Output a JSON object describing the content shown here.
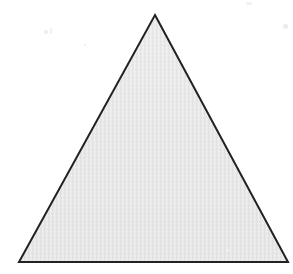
{
  "figure": {
    "canvas": {
      "width": 293,
      "height": 274,
      "background_color": "#ffffff"
    },
    "shape": {
      "name": "triangle",
      "kind": "polygon",
      "sides": 3,
      "orientation": "apex-up",
      "fill_color": "#e5e5e5",
      "stroke_color": "#222222",
      "stroke_width": 2,
      "texture": "halftone-noise",
      "points": "155,15 288,262 19,262",
      "vertices": [
        {
          "label": "apex",
          "x": 155,
          "y": 15
        },
        {
          "label": "bottom-right",
          "x": 288,
          "y": 262
        },
        {
          "label": "bottom-left",
          "x": 19,
          "y": 262
        }
      ],
      "measurements": {
        "base_width": 269,
        "height": 247
      }
    },
    "speckles": [
      {
        "name": "speckle-a"
      },
      {
        "name": "speckle-b"
      },
      {
        "name": "speckle-c"
      },
      {
        "name": "speckle-d"
      },
      {
        "name": "speckle-e"
      },
      {
        "name": "speckle-f"
      }
    ]
  }
}
